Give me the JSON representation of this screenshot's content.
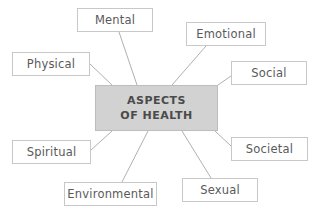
{
  "diagram": {
    "type": "spider-hub-and-spoke",
    "title": "Aspects of Health",
    "background_color": "#ffffff",
    "center": {
      "line1": "ASPECTS",
      "line2": "OF HEALTH",
      "fill_color": "#d2d2d2",
      "border_color": "#bdbdbd",
      "text_color": "#4a4a4a",
      "x": 95,
      "y": 85,
      "width": 123,
      "height": 46
    },
    "node_style": {
      "fill_color": "#ffffff",
      "border_color": "#c8c8c8",
      "text_color": "#5a5a5a"
    },
    "connector_color": "#b0b0b0",
    "nodes": [
      {
        "label": "Mental",
        "x": 77,
        "y": 8,
        "width": 76,
        "height": 24
      },
      {
        "label": "Emotional",
        "x": 186,
        "y": 22,
        "width": 80,
        "height": 24
      },
      {
        "label": "Physical",
        "x": 12,
        "y": 52,
        "width": 78,
        "height": 24
      },
      {
        "label": "Social",
        "x": 231,
        "y": 61,
        "width": 76,
        "height": 24
      },
      {
        "label": "Spiritual",
        "x": 12,
        "y": 140,
        "width": 79,
        "height": 24
      },
      {
        "label": "Societal",
        "x": 231,
        "y": 137,
        "width": 77,
        "height": 24
      },
      {
        "label": "Environmental",
        "x": 64,
        "y": 182,
        "width": 93,
        "height": 24
      },
      {
        "label": "Sexual",
        "x": 182,
        "y": 178,
        "width": 76,
        "height": 24
      }
    ],
    "connectors": [
      {
        "from": "Mental",
        "x1": 119,
        "y1": 32,
        "x2": 137,
        "y2": 85
      },
      {
        "from": "Emotional",
        "x1": 206,
        "y1": 46,
        "x2": 172,
        "y2": 85
      },
      {
        "from": "Physical",
        "x1": 90,
        "y1": 64,
        "x2": 112,
        "y2": 85
      },
      {
        "from": "Social",
        "x1": 231,
        "y1": 76,
        "x2": 218,
        "y2": 85
      },
      {
        "from": "Spiritual",
        "x1": 91,
        "y1": 150,
        "x2": 112,
        "y2": 131
      },
      {
        "from": "Societal",
        "x1": 231,
        "y1": 146,
        "x2": 215,
        "y2": 131
      },
      {
        "from": "Environmental",
        "x1": 122,
        "y1": 182,
        "x2": 148,
        "y2": 131
      },
      {
        "from": "Sexual",
        "x1": 211,
        "y1": 178,
        "x2": 182,
        "y2": 131
      }
    ]
  }
}
